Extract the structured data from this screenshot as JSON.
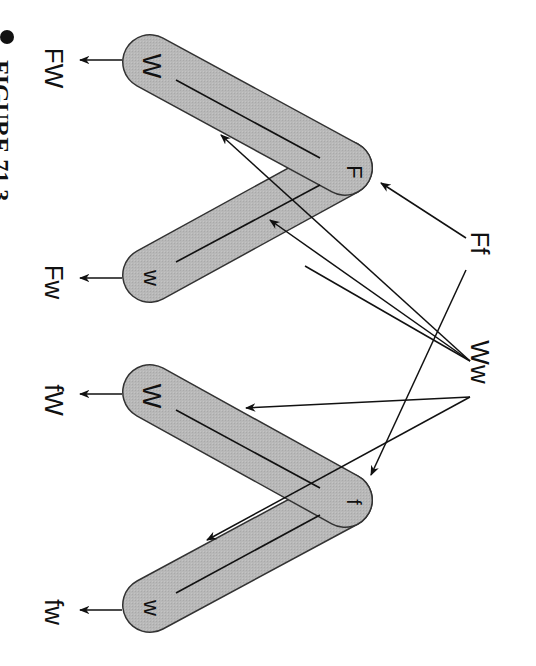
{
  "figure": {
    "caption": "FIGURE 71.3",
    "orientation": "rotated 90 degrees clockwise",
    "colors": {
      "capsule_fill": "#b5b5b5",
      "capsule_stroke": "#333333",
      "line": "#111111",
      "background": "#ffffff"
    }
  },
  "parents": {
    "gene_a": "Ff",
    "gene_b": "Ww"
  },
  "chromosome_pairs": [
    {
      "apex_allele": "F",
      "arm1_allele": "W",
      "arm2_allele": "w",
      "gametes": [
        "FW",
        "Fw"
      ]
    },
    {
      "apex_allele": "f",
      "arm1_allele": "W",
      "arm2_allele": "w",
      "gametes": [
        "fW",
        "fw"
      ]
    }
  ]
}
